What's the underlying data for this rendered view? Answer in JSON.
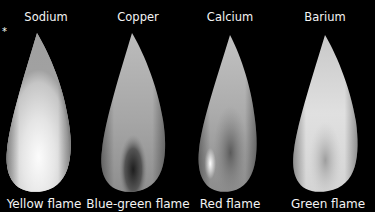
{
  "figure": {
    "marker": "*",
    "flames": [
      {
        "element": "Sodium",
        "result": "Yellow flame",
        "center_x": 46,
        "shading": "bright-uniform"
      },
      {
        "element": "Copper",
        "result": "Blue-green flame",
        "center_x": 138,
        "shading": "dark-core"
      },
      {
        "element": "Calcium",
        "result": "Red flame",
        "center_x": 230,
        "shading": "mid-gray-streak"
      },
      {
        "element": "Barium",
        "result": "Green flame",
        "center_x": 325,
        "shading": "bright-with-soft-core"
      }
    ],
    "colors": {
      "background": "#000000",
      "text": "#f4f4f4",
      "flame_light": "#f0f0f0",
      "flame_mid": "#a8a8a8",
      "flame_dark": "#3a3a3a"
    }
  }
}
